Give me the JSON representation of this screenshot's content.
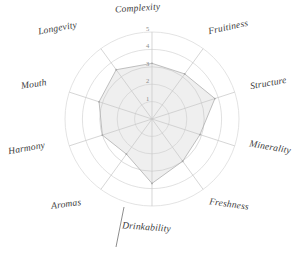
{
  "chart_data": {
    "type": "radar",
    "title": "",
    "subtitle": "",
    "xlabel": "",
    "ylabel": "",
    "grid": true,
    "legend": "none",
    "rlim": [
      0,
      5
    ],
    "ring_count": 5,
    "tick_labels": [
      "1",
      "2",
      "3",
      "4",
      "5"
    ],
    "tick_values": [
      1,
      2,
      3,
      4,
      5
    ],
    "categories": [
      "Complexity",
      "Fruitiness",
      "Structure",
      "Minerality",
      "Freshness",
      "Drinkability",
      "Aromas",
      "Harmony",
      "Mouth",
      "Longevity"
    ],
    "values": [
      3.2,
      3.2,
      3.8,
      2.9,
      3.0,
      3.7,
      2.5,
      3.0,
      3.2,
      3.5
    ],
    "series": [
      {
        "name": "Tasting profile",
        "values": [
          3.2,
          3.2,
          3.8,
          2.9,
          3.0,
          3.7,
          2.5,
          3.0,
          3.2,
          3.5
        ]
      }
    ],
    "colors": {
      "grid": "#cfcfcf",
      "spoke": "#c4c4c4",
      "outer_ring": "#d9d9d9",
      "fill": "#c9c9c9",
      "stroke": "#b0b0b0",
      "label_text": "#3a3a3a",
      "tick_text": "#8a8a8a",
      "background": "#ffffff",
      "leader_line": "#777777"
    },
    "annotations": [
      {
        "name": "drinkability-leader-line",
        "type": "line",
        "label": "Drinkability"
      }
    ]
  },
  "axis_labels": [
    {
      "text": "Complexity",
      "rotation": -4
    },
    {
      "text": "Fruitiness",
      "rotation": -12
    },
    {
      "text": "Structure",
      "rotation": -10
    },
    {
      "text": "Minerality",
      "rotation": 10
    },
    {
      "text": "Freshness",
      "rotation": 8
    },
    {
      "text": "Drinkability",
      "rotation": 4
    },
    {
      "text": "Aromas",
      "rotation": -8
    },
    {
      "text": "Harmony",
      "rotation": -10
    },
    {
      "text": "Mouth",
      "rotation": -8
    },
    {
      "text": "Longevity",
      "rotation": -10
    }
  ],
  "ticks": [
    {
      "text": "5"
    },
    {
      "text": "4"
    },
    {
      "text": "3"
    },
    {
      "text": "2"
    },
    {
      "text": "1"
    }
  ]
}
